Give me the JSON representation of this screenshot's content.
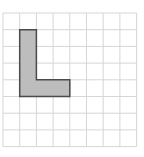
{
  "caption": "",
  "grid": {
    "origin_x": 3,
    "origin_y": 13,
    "cell_size": 16.7,
    "columns": 8,
    "rows": 8,
    "line_color": "#d6d6d6"
  },
  "shape": {
    "name": "L-shape",
    "cells": [
      [
        1,
        1
      ],
      [
        1,
        2
      ],
      [
        1,
        3
      ],
      [
        1,
        4
      ],
      [
        2,
        4
      ]
    ],
    "polygon_grid_units": [
      [
        1,
        1
      ],
      [
        2,
        1
      ],
      [
        2,
        4
      ],
      [
        4,
        4
      ],
      [
        4,
        5
      ],
      [
        1,
        5
      ]
    ],
    "fill_color": "#bdbdbd",
    "stroke_color": "#4a4a4a"
  }
}
